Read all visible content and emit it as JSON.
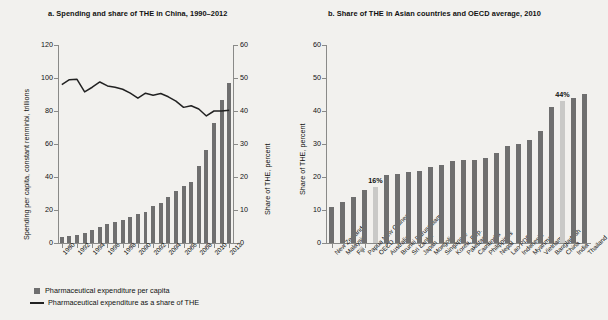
{
  "figure": {
    "background": "#f2f1ee",
    "bar_color": "#6f6f6f",
    "highlight_color": "#c9c9c7",
    "line_color": "#222222"
  },
  "panel_a": {
    "title": "a. Spending and share of THE in China, 1990–2012",
    "ylabel_left": "Spending per capita, constant renminbi, trillions",
    "ylabel_right": "Share of THE, percent",
    "legend": [
      {
        "type": "bar",
        "label": "Pharmaceutical expenditure per capita"
      },
      {
        "type": "line",
        "label": "Pharmaceutical expenditure as a share of THE"
      }
    ]
  },
  "panel_b": {
    "title": "b. Share of THE in Asian countries and OECD average, 2010",
    "ylabel": "Share of THE, percent",
    "annotations": [
      {
        "label": "16%",
        "category": "OECD"
      },
      {
        "label": "44%",
        "category": "China"
      }
    ]
  },
  "chart_data": [
    {
      "type": "bar",
      "id": "panel-a",
      "title": "a. Spending and share of THE in China, 1990–2012",
      "xlabel": "",
      "ylabel": "Spending per capita, constant renminbi, trillions",
      "ylabel2": "Share of THE, percent",
      "ylim": [
        0,
        120
      ],
      "ylim2": [
        0,
        60
      ],
      "yticks": [
        0,
        20,
        40,
        60,
        80,
        100,
        120
      ],
      "yticks2": [
        0,
        10,
        20,
        30,
        40,
        50,
        60
      ],
      "grid": false,
      "legend_position": "below",
      "categories": [
        "1990",
        "1991",
        "1992",
        "1993",
        "1994",
        "1995",
        "1996",
        "1997",
        "1998",
        "1999",
        "2000",
        "2001",
        "2002",
        "2003",
        "2004",
        "2005",
        "2006",
        "2007",
        "2008",
        "2009",
        "2010",
        "2011",
        "2012"
      ],
      "xtick_labels": [
        "1990",
        "1992",
        "1994",
        "1996",
        "1998",
        "2000",
        "2002",
        "2004",
        "2006",
        "2008",
        "2010",
        "2012"
      ],
      "series": [
        {
          "name": "Pharmaceutical expenditure per capita",
          "type": "bar",
          "axis": "left",
          "values": [
            3.5,
            4.0,
            4.6,
            5.9,
            7.6,
            9.4,
            11.6,
            12.6,
            14.1,
            15.9,
            17.5,
            18.6,
            22.2,
            24.2,
            27.6,
            31.7,
            34.6,
            36.7,
            46.7,
            56.6,
            73.0,
            86.5,
            97.0
          ]
        },
        {
          "name": "Pharmaceutical expenditure as a share of THE",
          "type": "line",
          "axis": "right",
          "values": [
            48.0,
            49.5,
            49.6,
            45.8,
            47.2,
            48.8,
            47.6,
            47.2,
            46.6,
            45.4,
            43.9,
            45.4,
            44.8,
            45.3,
            44.3,
            43.0,
            41.1,
            41.6,
            40.6,
            38.5,
            40.0,
            40.0,
            40.2
          ]
        }
      ]
    },
    {
      "type": "bar",
      "id": "panel-b",
      "title": "b. Share of THE in Asian countries and OECD average, 2010",
      "xlabel": "",
      "ylabel": "Share of THE, percent",
      "ylim": [
        0,
        60
      ],
      "yticks": [
        0,
        10,
        20,
        30,
        40,
        50,
        60
      ],
      "grid": false,
      "legend_position": "none",
      "categories": [
        "New Zealand",
        "Malaysia",
        "Fiji",
        "Papua New Guinea",
        "OECD",
        "Australia",
        "Brunei Darussalam",
        "Sri Lanka",
        "Japan",
        "Mongolia",
        "Singapore",
        "Korea, Rep.",
        "Pakistan",
        "Cambodia",
        "Philippines",
        "Nepal",
        "Lao PDR",
        "Indonesia",
        "Myanmar",
        "Vietnam",
        "Bangladesh",
        "China",
        "India",
        "Thailand"
      ],
      "values": [
        11.0,
        12.5,
        14.0,
        16.0,
        17.0,
        20.5,
        21.0,
        21.5,
        21.7,
        23.0,
        23.5,
        25.0,
        25.2,
        25.2,
        25.9,
        27.4,
        29.5,
        30.0,
        31.3,
        34.0,
        41.2,
        43.1,
        44.0,
        45.2
      ],
      "highlighted": [
        "OECD",
        "China"
      ],
      "data_labels": {
        "OECD": "16%",
        "China": "44%"
      }
    }
  ]
}
